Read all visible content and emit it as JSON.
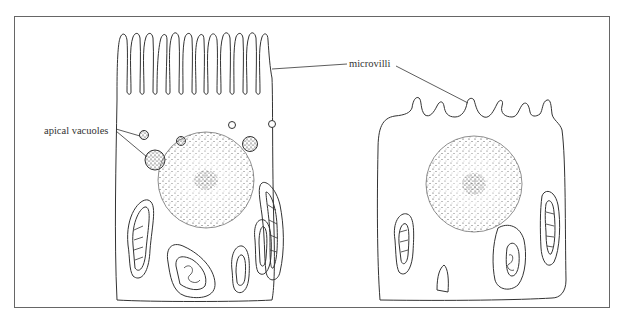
{
  "figure": {
    "type": "biological cell diagram",
    "labels": {
      "apical_vacuoles": "apical vacuoles",
      "microvilli": "microvilli"
    },
    "structures": {
      "left_cell": [
        "microvilli (dense brush border)",
        "apical vacuoles",
        "nucleus",
        "mitochondria"
      ],
      "right_cell": [
        "microvilli (sparse)",
        "nucleus",
        "mitochondria"
      ]
    }
  },
  "colors": {
    "line": "#333333",
    "frame": "#555555",
    "background": "#ffffff"
  }
}
